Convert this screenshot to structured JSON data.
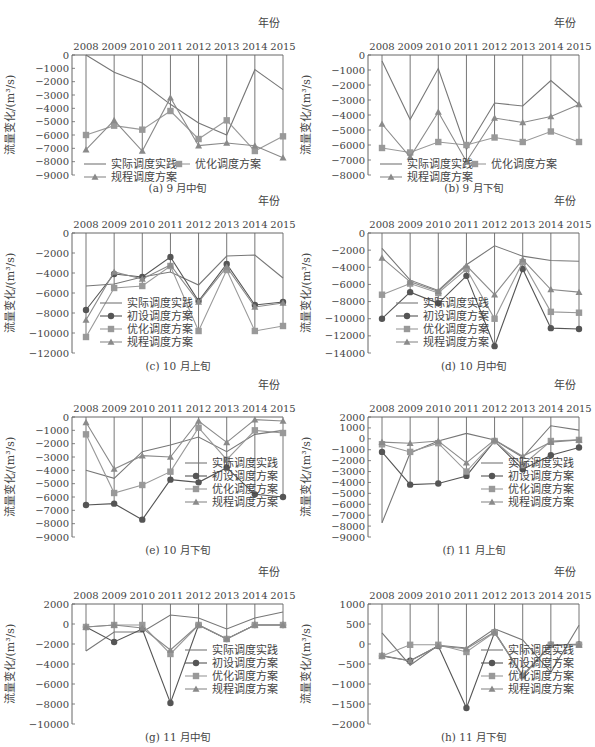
{
  "figure": {
    "years": [
      "2008",
      "2009",
      "2010",
      "2011",
      "2012",
      "2013",
      "2014",
      "2015"
    ],
    "x_axis_label": "年份",
    "y_axis_label": "流量变化/(m³/s)",
    "legend_labels": {
      "actual": "实际调度实践",
      "initial": "初设调度方案",
      "optimized": "优化调度方案",
      "regulation": "规程调度方案"
    },
    "colors": {
      "actual": "#777777",
      "initial": "#555555",
      "optimized": "#999999",
      "regulation": "#8a8a8a",
      "axis": "#666666"
    }
  },
  "chart_data": [
    {
      "id": "a",
      "type": "line",
      "title": "(a) 9 月中旬",
      "xlabel": "年份",
      "ylabel": "流量变化/(m³/s)",
      "categories": [
        "2008",
        "2009",
        "2010",
        "2011",
        "2012",
        "2013",
        "2014",
        "2015"
      ],
      "ylim": [
        -9000,
        0
      ],
      "yticks": [
        0,
        -1000,
        -2000,
        -3000,
        -4000,
        -5000,
        -6000,
        -7000,
        -8000,
        -9000
      ],
      "series": [
        {
          "key": "actual",
          "name": "实际调度实践",
          "values": [
            0,
            -1300,
            -2100,
            -3700,
            -5100,
            -6000,
            -1100,
            -2600
          ]
        },
        {
          "key": "optimized",
          "name": "优化调度方案",
          "values": [
            -6000,
            -5300,
            -5600,
            -4200,
            -6300,
            -4900,
            -7200,
            -6100
          ]
        },
        {
          "key": "regulation",
          "name": "规程调度方案",
          "values": [
            -7100,
            -4900,
            -7200,
            -3200,
            -6800,
            -6600,
            -6800,
            -7700
          ]
        }
      ],
      "legend_layout": "two-row"
    },
    {
      "id": "b",
      "type": "line",
      "title": "(b) 9 月下旬",
      "xlabel": "年份",
      "ylabel": "流量变化/(m³/s)",
      "categories": [
        "2008",
        "2009",
        "2010",
        "2011",
        "2012",
        "2013",
        "2014",
        "2015"
      ],
      "ylim": [
        -8000,
        0
      ],
      "yticks": [
        0,
        -1000,
        -2000,
        -3000,
        -4000,
        -5000,
        -6000,
        -7000,
        -8000
      ],
      "series": [
        {
          "key": "actual",
          "name": "实际调度实践",
          "values": [
            -400,
            -4300,
            -900,
            -6300,
            -3200,
            -3400,
            -1700,
            -3300
          ]
        },
        {
          "key": "optimized",
          "name": "优化调度方案",
          "values": [
            -6200,
            -6500,
            -5800,
            -6000,
            -5500,
            -5800,
            -5100,
            -5800
          ]
        },
        {
          "key": "regulation",
          "name": "规程调度方案",
          "values": [
            -4600,
            -6800,
            -3800,
            -7100,
            -4200,
            -4500,
            -4100,
            -3300
          ]
        }
      ],
      "legend_layout": "two-row"
    },
    {
      "id": "c",
      "type": "line",
      "title": "(c) 10 月上旬",
      "xlabel": "年份",
      "ylabel": "流量变化/(m³/s)",
      "categories": [
        "2008",
        "2009",
        "2010",
        "2011",
        "2012",
        "2013",
        "2014",
        "2015"
      ],
      "ylim": [
        -12000,
        0
      ],
      "yticks": [
        0,
        -2000,
        -4000,
        -6000,
        -8000,
        -10000,
        -12000
      ],
      "series": [
        {
          "key": "actual",
          "name": "实际调度实践",
          "values": [
            -5300,
            -5100,
            -4400,
            -3900,
            -5200,
            -2300,
            -2200,
            -4500
          ]
        },
        {
          "key": "initial",
          "name": "初设调度方案",
          "values": [
            -7700,
            -4100,
            -4400,
            -2400,
            -6800,
            -3100,
            -7200,
            -6900
          ]
        },
        {
          "key": "optimized",
          "name": "优化调度方案",
          "values": [
            -10400,
            -5500,
            -5300,
            -3300,
            -9800,
            -3700,
            -9800,
            -9300
          ]
        },
        {
          "key": "regulation",
          "name": "规程调度方案",
          "values": [
            -8700,
            -3900,
            -4600,
            -3200,
            -6900,
            -3400,
            -7400,
            -7000
          ]
        }
      ],
      "legend_layout": "stack-left"
    },
    {
      "id": "d",
      "type": "line",
      "title": "(d) 10 月中旬",
      "xlabel": "年份",
      "ylabel": "流量变化/(m³/s)",
      "categories": [
        "2008",
        "2009",
        "2010",
        "2011",
        "2012",
        "2013",
        "2014",
        "2015"
      ],
      "ylim": [
        -14000,
        0
      ],
      "yticks": [
        0,
        -2000,
        -4000,
        -6000,
        -8000,
        -10000,
        -12000,
        -14000
      ],
      "series": [
        {
          "key": "actual",
          "name": "实际调度实践",
          "values": [
            -1800,
            -5500,
            -6700,
            -3700,
            -1500,
            -2700,
            -3200,
            -3300
          ]
        },
        {
          "key": "initial",
          "name": "初设调度方案",
          "values": [
            -10000,
            -6900,
            -8200,
            -5000,
            -13200,
            -4200,
            -11100,
            -11200
          ]
        },
        {
          "key": "optimized",
          "name": "优化调度方案",
          "values": [
            -7200,
            -5900,
            -7000,
            -4200,
            -10000,
            -3400,
            -9200,
            -9300
          ]
        },
        {
          "key": "regulation",
          "name": "规程调度方案",
          "values": [
            -2900,
            -5700,
            -6800,
            -3800,
            -7200,
            -3100,
            -6600,
            -6900
          ]
        }
      ],
      "legend_layout": "stack-left"
    },
    {
      "id": "e",
      "type": "line",
      "title": "(e) 10 月下旬",
      "xlabel": "年份",
      "ylabel": "流量变化/(m³/s)",
      "categories": [
        "2008",
        "2009",
        "2010",
        "2011",
        "2012",
        "2013",
        "2014",
        "2015"
      ],
      "ylim": [
        -9000,
        0
      ],
      "yticks": [
        0,
        -1000,
        -2000,
        -3000,
        -4000,
        -5000,
        -6000,
        -7000,
        -8000,
        -9000
      ],
      "series": [
        {
          "key": "actual",
          "name": "实际调度实践",
          "values": [
            -4000,
            -4600,
            -2600,
            -2100,
            -1500,
            -2600,
            -1300,
            -1000
          ]
        },
        {
          "key": "initial",
          "name": "初设调度方案",
          "values": [
            -6600,
            -6500,
            -7700,
            -4700,
            -4900,
            -3800,
            -5800,
            -6000
          ]
        },
        {
          "key": "optimized",
          "name": "优化调度方案",
          "values": [
            -1300,
            -5700,
            -5100,
            -4100,
            -800,
            -3200,
            -1000,
            -1200
          ]
        },
        {
          "key": "regulation",
          "name": "规程调度方案",
          "values": [
            -400,
            -3900,
            -2900,
            -3000,
            -300,
            -1900,
            -200,
            -300
          ]
        }
      ],
      "legend_layout": "stack-right"
    },
    {
      "id": "f",
      "type": "line",
      "title": "(f) 11 月上旬",
      "xlabel": "年份",
      "ylabel": "流量变化/(m³/s)",
      "categories": [
        "2008",
        "2009",
        "2010",
        "2011",
        "2012",
        "2013",
        "2014",
        "2015"
      ],
      "ylim": [
        -9000,
        2000
      ],
      "yticks": [
        2000,
        1000,
        0,
        -1000,
        -2000,
        -3000,
        -4000,
        -5000,
        -6000,
        -7000,
        -8000,
        -9000
      ],
      "series": [
        {
          "key": "actual",
          "name": "实际调度实践",
          "values": [
            -7700,
            -1300,
            -200,
            500,
            -100,
            -1700,
            1200,
            800
          ]
        },
        {
          "key": "initial",
          "name": "初设调度方案",
          "values": [
            -1200,
            -4200,
            -4100,
            -3400,
            -200,
            -2800,
            -1500,
            -800
          ]
        },
        {
          "key": "optimized",
          "name": "优化调度方案",
          "values": [
            -500,
            -1200,
            -400,
            -3000,
            -200,
            -2400,
            -200,
            -100
          ]
        },
        {
          "key": "regulation",
          "name": "规程调度方案",
          "values": [
            -300,
            -400,
            -200,
            -2200,
            -100,
            -1600,
            -300,
            -100
          ]
        }
      ],
      "legend_layout": "stack-right"
    },
    {
      "id": "g",
      "type": "line",
      "title": "(g) 11 月中旬",
      "xlabel": "年份",
      "ylabel": "流量变化/(m³/s)",
      "categories": [
        "2008",
        "2009",
        "2010",
        "2011",
        "2012",
        "2013",
        "2014",
        "2015"
      ],
      "ylim": [
        -10000,
        2000
      ],
      "yticks": [
        2000,
        0,
        -2000,
        -4000,
        -6000,
        -8000,
        -10000
      ],
      "series": [
        {
          "key": "actual",
          "name": "实际调度实践",
          "values": [
            -2700,
            -800,
            -800,
            900,
            600,
            -500,
            600,
            1200
          ]
        },
        {
          "key": "initial",
          "name": "初设调度方案",
          "values": [
            -300,
            -1800,
            -500,
            -7900,
            -100,
            -1500,
            -100,
            -100
          ]
        },
        {
          "key": "optimized",
          "name": "优化调度方案",
          "values": [
            -300,
            -100,
            -100,
            -3000,
            -100,
            -1500,
            -100,
            -100
          ]
        },
        {
          "key": "regulation",
          "name": "规程调度方案",
          "values": [
            -300,
            -100,
            -400,
            -2600,
            -100,
            -1500,
            -100,
            -100
          ]
        }
      ],
      "legend_layout": "stack-right"
    },
    {
      "id": "h",
      "type": "line",
      "title": "(h) 11 月下旬",
      "xlabel": "年份",
      "ylabel": "流量变化/(m³/s)",
      "categories": [
        "2008",
        "2009",
        "2010",
        "2011",
        "2012",
        "2013",
        "2014",
        "2015"
      ],
      "ylim": [
        -2000,
        1000
      ],
      "yticks": [
        1000,
        500,
        0,
        -500,
        -1000,
        -1500,
        -2000
      ],
      "series": [
        {
          "key": "actual",
          "name": "实际调度实践",
          "values": [
            280,
            -530,
            -30,
            -100,
            380,
            100,
            -710,
            470
          ]
        },
        {
          "key": "initial",
          "name": "初设调度方案",
          "values": [
            -300,
            -420,
            -50,
            -1600,
            290,
            -800,
            -20,
            -10
          ]
        },
        {
          "key": "optimized",
          "name": "优化调度方案",
          "values": [
            -300,
            -20,
            -20,
            -200,
            290,
            -800,
            -20,
            -20
          ]
        },
        {
          "key": "regulation",
          "name": "规程调度方案",
          "values": [
            -290,
            -420,
            -50,
            -120,
            300,
            -780,
            -20,
            -20
          ]
        }
      ],
      "legend_layout": "stack-right"
    }
  ]
}
